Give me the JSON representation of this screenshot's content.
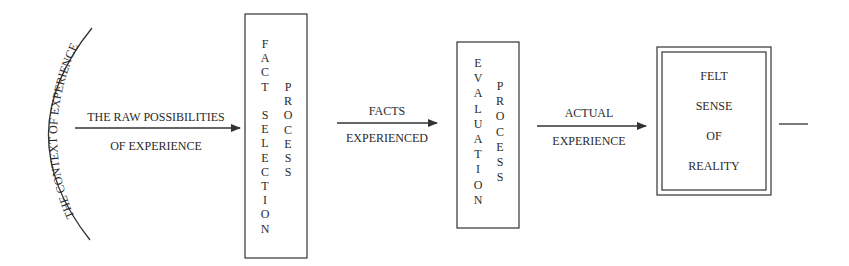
{
  "diagram": {
    "context": {
      "label": "THE CONTEXT OF EXPERIENCE"
    },
    "arrows": [
      {
        "top_label": "THE RAW POSSIBILITIES",
        "bottom_label": "OF EXPERIENCE"
      },
      {
        "top_label": "FACTS",
        "bottom_label": "EXPERIENCED"
      },
      {
        "top_label": "ACTUAL",
        "bottom_label": "EXPERIENCE"
      }
    ],
    "boxes": [
      {
        "name": "fact-selection-process",
        "column1": [
          "F",
          "A",
          "C",
          "T",
          "",
          "S",
          "E",
          "L",
          "E",
          "C",
          "T",
          "I",
          "O",
          "N"
        ],
        "column2": [
          "P",
          "R",
          "O",
          "C",
          "E",
          "S",
          "S"
        ]
      },
      {
        "name": "evaluation-process",
        "column1": [
          "E",
          "V",
          "A",
          "L",
          "U",
          "A",
          "T",
          "I",
          "O",
          "N"
        ],
        "column2": [
          "P",
          "R",
          "O",
          "C",
          "E",
          "S",
          "S"
        ]
      }
    ],
    "final_box": {
      "lines": [
        "FELT",
        "SENSE",
        "OF",
        "REALITY"
      ]
    },
    "colors": {
      "stroke": "#333333",
      "text": "#2a2a2a",
      "background": "#ffffff"
    }
  }
}
